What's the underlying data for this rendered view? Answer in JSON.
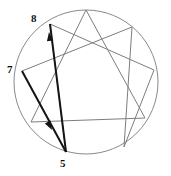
{
  "figure": {
    "name": "enneagram-diagram",
    "type": "enneagram",
    "background_color": "#ffffff",
    "width": 171,
    "height": 176
  },
  "circle": {
    "name": "enneagram-circle",
    "center_x": 86,
    "center_y": 82,
    "radius": 72,
    "stroke_color": "#8a8a8a",
    "stroke_width": 1
  },
  "vertices": [
    {
      "point": "9",
      "x": 86,
      "y": 10,
      "angle_deg": 90
    },
    {
      "point": "1",
      "x": 132,
      "y": 27,
      "angle_deg": 50
    },
    {
      "point": "2",
      "x": 154,
      "y": 70,
      "angle_deg": 10
    },
    {
      "point": "3",
      "x": 145,
      "y": 118,
      "angle_deg": -30
    },
    {
      "point": "4",
      "x": 124,
      "y": 147,
      "angle_deg": -66
    },
    {
      "point": "5",
      "x": 66,
      "y": 152,
      "angle_deg": -105
    },
    {
      "point": "6",
      "x": 31,
      "y": 122,
      "angle_deg": -150
    },
    {
      "point": "7",
      "x": 22,
      "y": 71,
      "angle_deg": 170
    },
    {
      "point": "8",
      "x": 50,
      "y": 24,
      "angle_deg": 130
    }
  ],
  "inner_lines": {
    "stroke_color": "#7d7d7d",
    "stroke_width": 1,
    "triangle": [
      "9",
      "3",
      "6"
    ],
    "hexad": [
      "1",
      "4",
      "2",
      "8",
      "5",
      "7"
    ]
  },
  "highlighted_arrows": [
    {
      "name": "arrow-8-to-5",
      "from": "8",
      "to": "5",
      "from_x": 50,
      "from_y": 24,
      "to_x": 66,
      "to_y": 152,
      "arrowhead_at": "from",
      "arrowhead_x": 49,
      "arrowhead_y": 32,
      "stroke_color": "#141414",
      "stroke_width": 2
    },
    {
      "name": "arrow-7-to-5",
      "from": "7",
      "to": "5",
      "from_x": 22,
      "from_y": 71,
      "to_x": 66,
      "to_y": 152,
      "arrowhead_at": "to",
      "arrowhead_x": 52,
      "arrowhead_y": 130,
      "stroke_color": "#141414",
      "stroke_width": 2
    }
  ],
  "labels": {
    "eight": "8",
    "seven": "7",
    "five": "5"
  }
}
